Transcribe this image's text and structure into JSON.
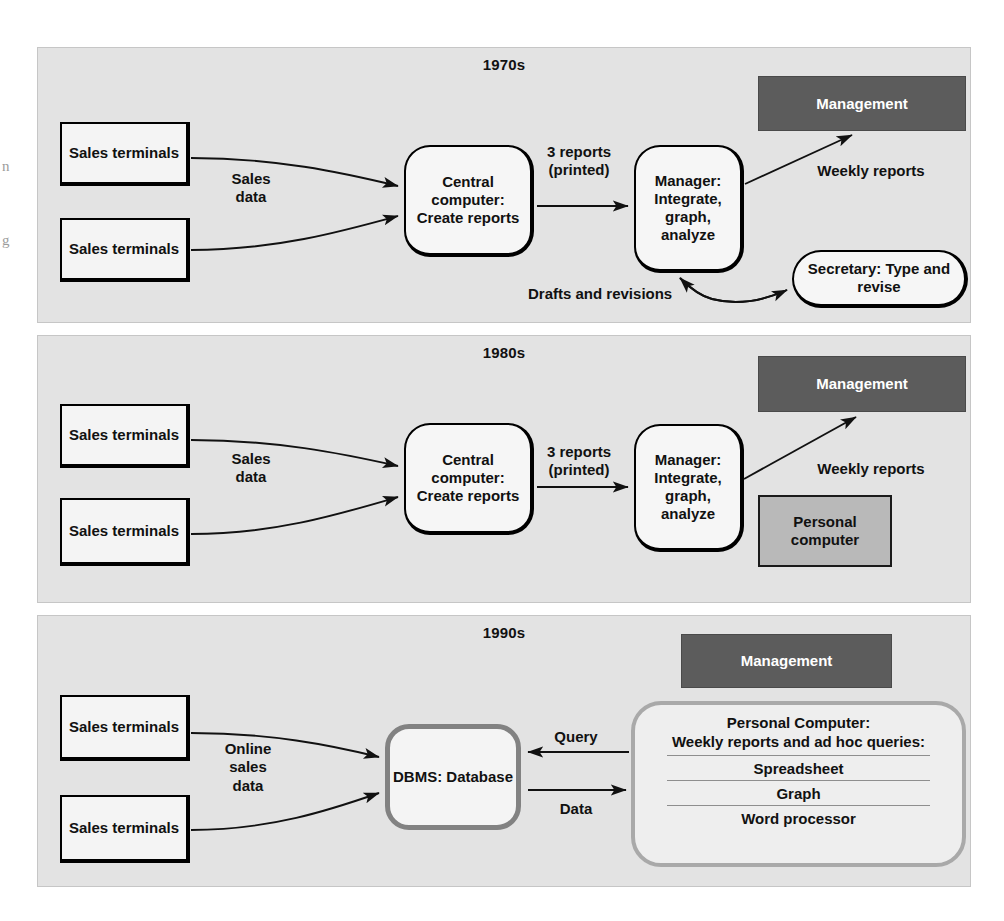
{
  "figure": {
    "edge_bleed": [
      "n",
      "g"
    ],
    "colors": {
      "panel_bg": "#e3e3e3",
      "panel_border": "#c6c6c6",
      "node_fill": "#f4f4f4",
      "node_stroke": "#000000",
      "management_fill": "#5c5c5c",
      "management_text": "#ffffff",
      "pc_gray_fill": "#b9b9b9",
      "dbms_stroke": "#828282",
      "pc90_stroke": "#a9a9a9",
      "arrow_stroke": "#111111"
    }
  },
  "panels": [
    {
      "id": "panel-1970s",
      "title": "1970s",
      "nodes": {
        "terminal_top": "Sales\nterminals",
        "terminal_bottom": "Sales\nterminals",
        "central_computer": "Central\ncomputer:\nCreate reports",
        "manager": "Manager:\nIntegrate,\ngraph,\nanalyze",
        "management": "Management",
        "secretary": "Secretary:\nType and revise"
      },
      "edge_labels": {
        "sales_data": "Sales\ndata",
        "reports": "3 reports\n(printed)",
        "weekly_reports": "Weekly reports",
        "drafts": "Drafts and revisions"
      }
    },
    {
      "id": "panel-1980s",
      "title": "1980s",
      "nodes": {
        "terminal_top": "Sales\nterminals",
        "terminal_bottom": "Sales\nterminals",
        "central_computer": "Central\ncomputer:\nCreate reports",
        "manager": "Manager:\nIntegrate,\ngraph,\nanalyze",
        "management": "Management",
        "personal_computer": "Personal\ncomputer"
      },
      "edge_labels": {
        "sales_data": "Sales\ndata",
        "reports": "3 reports\n(printed)",
        "weekly_reports": "Weekly reports"
      }
    },
    {
      "id": "panel-1990s",
      "title": "1990s",
      "nodes": {
        "terminal_top": "Sales\nterminals",
        "terminal_bottom": "Sales\nterminals",
        "dbms": "DBMS:\nDatabase",
        "management": "Management",
        "personal_computer": {
          "heading": "Personal Computer:\nWeekly reports and ad hoc queries:",
          "applications": [
            "Spreadsheet",
            "Graph",
            "Word processor"
          ]
        }
      },
      "edge_labels": {
        "online_sales_data": "Online\nsales\ndata",
        "query": "Query",
        "data": "Data"
      }
    }
  ]
}
